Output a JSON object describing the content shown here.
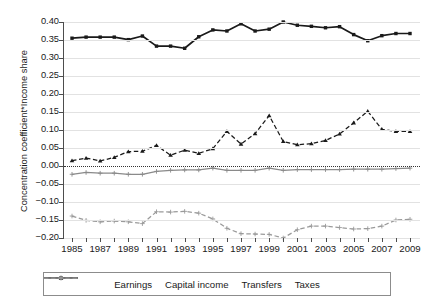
{
  "chart_data": {
    "type": "line",
    "title": "",
    "subtitle": "",
    "xlabel": "",
    "ylabel": "Concentration coefficient*Income share",
    "xlim": [
      1985,
      2009
    ],
    "ylim": [
      -0.2,
      0.4
    ],
    "ytick_step": 0.05,
    "grid": true,
    "grid_axis": "y",
    "zero_reference_line": true,
    "legend_position": "bottom",
    "x": [
      1985,
      1986,
      1987,
      1988,
      1989,
      1990,
      1991,
      1992,
      1993,
      1994,
      1995,
      1996,
      1997,
      1998,
      1999,
      2000,
      2001,
      2002,
      2003,
      2004,
      2005,
      2006,
      2007,
      2008,
      2009
    ],
    "xtick_labels": [
      "1985",
      "1987",
      "1989",
      "1991",
      "1993",
      "1995",
      "1997",
      "1999",
      "2001",
      "2003",
      "2005",
      "2007",
      "2009"
    ],
    "xtick_values": [
      1985,
      1987,
      1989,
      1991,
      1993,
      1995,
      1997,
      1999,
      2001,
      2003,
      2005,
      2007,
      2009
    ],
    "ytick_labels": [
      "0.40",
      "0.35",
      "0.30",
      "0.25",
      "0.20",
      "0.15",
      "0.10",
      "0.05",
      "0.00",
      "−0.05",
      "−0.10",
      "−0.15",
      "−0.20"
    ],
    "ytick_values": [
      0.4,
      0.35,
      0.3,
      0.25,
      0.2,
      0.15,
      0.1,
      0.05,
      0.0,
      -0.05,
      -0.1,
      -0.15,
      -0.2
    ],
    "series": [
      {
        "name": "Earnings",
        "color": "#1a1a1a",
        "style": "solid",
        "marker": "square",
        "values": [
          0.355,
          0.358,
          0.358,
          0.358,
          0.351,
          0.361,
          0.333,
          0.333,
          0.327,
          0.359,
          0.378,
          0.375,
          0.395,
          0.375,
          0.38,
          0.4,
          0.391,
          0.388,
          0.384,
          0.387,
          0.365,
          0.348,
          0.362,
          0.368,
          0.368
        ]
      },
      {
        "name": "Capital income",
        "color": "#1a1a1a",
        "style": "dashed",
        "marker": "triangle",
        "values": [
          0.015,
          0.022,
          0.014,
          0.024,
          0.04,
          0.041,
          0.057,
          0.03,
          0.044,
          0.035,
          0.048,
          0.096,
          0.061,
          0.09,
          0.14,
          0.068,
          0.059,
          0.062,
          0.071,
          0.089,
          0.12,
          0.152,
          0.102,
          0.096,
          0.096
        ]
      },
      {
        "name": "Transfers",
        "color": "#8a8a8a",
        "style": "solid",
        "marker": "plus",
        "values": [
          -0.023,
          -0.018,
          -0.02,
          -0.02,
          -0.023,
          -0.023,
          -0.015,
          -0.012,
          -0.011,
          -0.011,
          -0.006,
          -0.012,
          -0.012,
          -0.012,
          -0.006,
          -0.012,
          -0.01,
          -0.01,
          -0.01,
          -0.01,
          -0.009,
          -0.009,
          -0.009,
          -0.007,
          -0.006
        ]
      },
      {
        "name": "Taxes",
        "color": "#9a9a9a",
        "style": "dashed",
        "marker": "plus",
        "values": [
          -0.139,
          -0.151,
          -0.155,
          -0.153,
          -0.155,
          -0.16,
          -0.127,
          -0.128,
          -0.126,
          -0.131,
          -0.147,
          -0.173,
          -0.188,
          -0.189,
          -0.19,
          -0.2,
          -0.177,
          -0.167,
          -0.167,
          -0.171,
          -0.175,
          -0.174,
          -0.167,
          -0.15,
          -0.148
        ]
      }
    ]
  },
  "legend": {
    "items": [
      {
        "label": "Earnings",
        "swatch": "solid-black-square-marker"
      },
      {
        "label": "Capital income",
        "swatch": "dashed-black-triangle-marker"
      },
      {
        "label": "Transfers",
        "swatch": "solid-gray-plus-marker"
      },
      {
        "label": "Taxes",
        "swatch": "dashed-gray-plus-marker"
      }
    ]
  }
}
